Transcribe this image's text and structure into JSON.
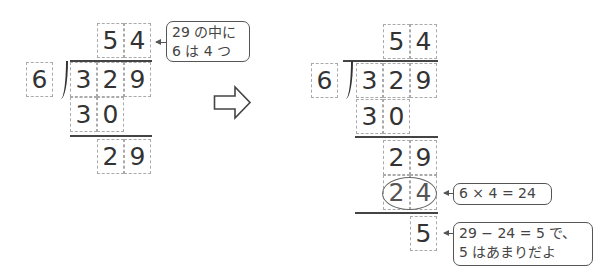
{
  "left": {
    "quotient": [
      "5",
      "4"
    ],
    "divisor": "6",
    "dividend": [
      "3",
      "2",
      "9"
    ],
    "step1_product": [
      "3",
      "0"
    ],
    "step1_remainder": [
      "2",
      "9"
    ],
    "callout": {
      "line1": "29 の中に",
      "line2": "6 は 4 つ"
    }
  },
  "transition_arrow": "right-arrow",
  "right": {
    "quotient": [
      "5",
      "4"
    ],
    "divisor": "6",
    "dividend": [
      "3",
      "2",
      "9"
    ],
    "step1_product": [
      "3",
      "0"
    ],
    "step1_remainder": [
      "2",
      "9"
    ],
    "step2_product": [
      "2",
      "4"
    ],
    "remainder": "5",
    "callout_product": "6 × 4 = 24",
    "callout_remainder": {
      "line1": "29 − 24 = 5 で、",
      "line2": "5 はあまりだよ"
    }
  }
}
